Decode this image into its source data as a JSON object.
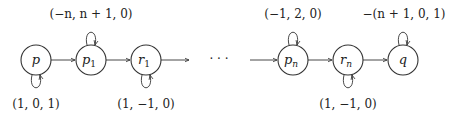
{
  "diagram": {
    "type": "state-machine",
    "nodes": [
      {
        "id": "p",
        "label": "p",
        "sub": "",
        "cx": 36
      },
      {
        "id": "p1",
        "label": "p",
        "sub": "1",
        "cx": 91
      },
      {
        "id": "r1",
        "label": "r",
        "sub": "1",
        "cx": 146
      },
      {
        "id": "pn",
        "label": "p",
        "sub": "n",
        "cx": 293
      },
      {
        "id": "rn",
        "label": "r",
        "sub": "n",
        "cx": 348
      },
      {
        "id": "q",
        "label": "q",
        "sub": "",
        "cx": 403
      }
    ],
    "ellipsis": "· · ·",
    "loops": [
      {
        "node": "p",
        "position": "below",
        "label": "(1, 0, 1)"
      },
      {
        "node": "p1",
        "position": "above",
        "label": "(−n, n + 1, 0)"
      },
      {
        "node": "r1",
        "position": "below",
        "label": "(1, −1, 0)"
      },
      {
        "node": "pn",
        "position": "above",
        "label": "(−1, 2, 0)"
      },
      {
        "node": "rn",
        "position": "below",
        "label": "(1, −1, 0)"
      },
      {
        "node": "q",
        "position": "above",
        "label": "−(n + 1, 0, 1)"
      }
    ],
    "edges": [
      {
        "from": "p",
        "to": "p1"
      },
      {
        "from": "p1",
        "to": "r1"
      },
      {
        "from": "r1",
        "to": "ellipsis"
      },
      {
        "from": "ellipsis",
        "to": "pn"
      },
      {
        "from": "pn",
        "to": "rn"
      },
      {
        "from": "rn",
        "to": "q"
      }
    ]
  }
}
